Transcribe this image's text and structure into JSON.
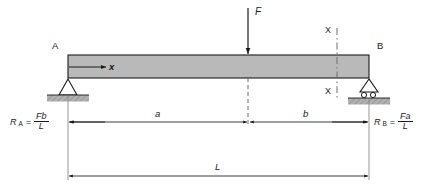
{
  "figure": {
    "type": "free-body-diagram",
    "background": "#ffffff",
    "line_color": "#1a1a1a",
    "beam_fill": "#b9b9b9",
    "hatch_fill": "#a8a8a8"
  },
  "nodes": {
    "left_label": "A",
    "right_label": "B"
  },
  "load": {
    "label": "F",
    "direction": "down"
  },
  "axis": {
    "label": "x",
    "direction": "right"
  },
  "section": {
    "top_label": "X",
    "bottom_label": "X"
  },
  "dimensions": [
    {
      "name": "a",
      "label": "a"
    },
    {
      "name": "b",
      "label": "b"
    },
    {
      "name": "L",
      "label": "L"
    }
  ],
  "reactions": {
    "left": {
      "symbol": "R",
      "subscript": "A",
      "equals": "=",
      "numerator": "Fb",
      "denominator": "L"
    },
    "right": {
      "symbol": "R",
      "subscript": "B",
      "equals": "=",
      "numerator": "Fa",
      "denominator": "L"
    }
  },
  "supports": {
    "left_type": "pin-support",
    "right_type": "roller-support"
  }
}
